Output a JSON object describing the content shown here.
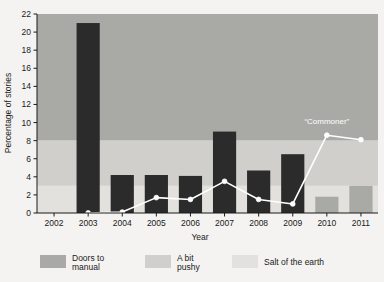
{
  "chart_data": {
    "type": "bar",
    "title": "",
    "xlabel": "Year",
    "ylabel": "Percentage of stories",
    "categories": [
      "2002",
      "2003",
      "2004",
      "2005",
      "2006",
      "2007",
      "2008",
      "2009",
      "2010",
      "2011"
    ],
    "xlim": [
      2002,
      2011
    ],
    "ylim": [
      0,
      22
    ],
    "yticks": [
      0,
      2,
      4,
      6,
      8,
      10,
      12,
      14,
      16,
      18,
      20,
      22
    ],
    "grid": false,
    "legend_position": "bottom",
    "series": [
      {
        "name": "bars",
        "type": "bar",
        "values": [
          null,
          21.0,
          4.2,
          4.2,
          4.1,
          9.0,
          4.7,
          6.5,
          1.8,
          3.0
        ]
      },
      {
        "name": "Commoner",
        "type": "line",
        "marker": "circle-white",
        "values": [
          null,
          0.0,
          0.1,
          1.7,
          1.5,
          3.5,
          1.5,
          1.0,
          8.6,
          8.1
        ]
      }
    ],
    "annotations": [
      {
        "text": "“Commoner”",
        "x": "2010",
        "y": 9.8
      }
    ],
    "bands": [
      {
        "label": "Salt of the earth",
        "from": 0,
        "to": 3,
        "color": "#e2e1de"
      },
      {
        "label": "A bit pushy",
        "from": 3,
        "to": 8,
        "color": "#d0cfcb"
      },
      {
        "label": "Doors to manual",
        "from": 8,
        "to": 22,
        "color": "#a9a9a6"
      }
    ]
  },
  "axes": {
    "y_title": "Percentage of stories",
    "x_title": "Year",
    "y_ticks": [
      "0",
      "2",
      "4",
      "6",
      "8",
      "10",
      "12",
      "14",
      "16",
      "18",
      "20",
      "22"
    ],
    "x_ticks": [
      "2002",
      "2003",
      "2004",
      "2005",
      "2006",
      "2007",
      "2008",
      "2009",
      "2010",
      "2011"
    ]
  },
  "legend": {
    "items": [
      {
        "label_line1": "Doors to",
        "label_line2": "manual",
        "color": "#a9a9a6"
      },
      {
        "label_line1": "A bit",
        "label_line2": "pushy",
        "color": "#d0cfcb"
      },
      {
        "label_line1": "Salt of the earth",
        "label_line2": "",
        "color": "#e2e1de"
      }
    ]
  },
  "annotation": {
    "commoner": "“Commoner”"
  },
  "colors": {
    "background": "#f4f3f1",
    "bar_dark": "#2b2b2b",
    "bar_light": "#a9a9a6",
    "line": "#ffffff",
    "marker_fill": "#ffffff",
    "axis": "#1a1a1a",
    "band_top": "#a9a9a6",
    "band_mid": "#d0cfcb",
    "band_low": "#e2e1de"
  }
}
